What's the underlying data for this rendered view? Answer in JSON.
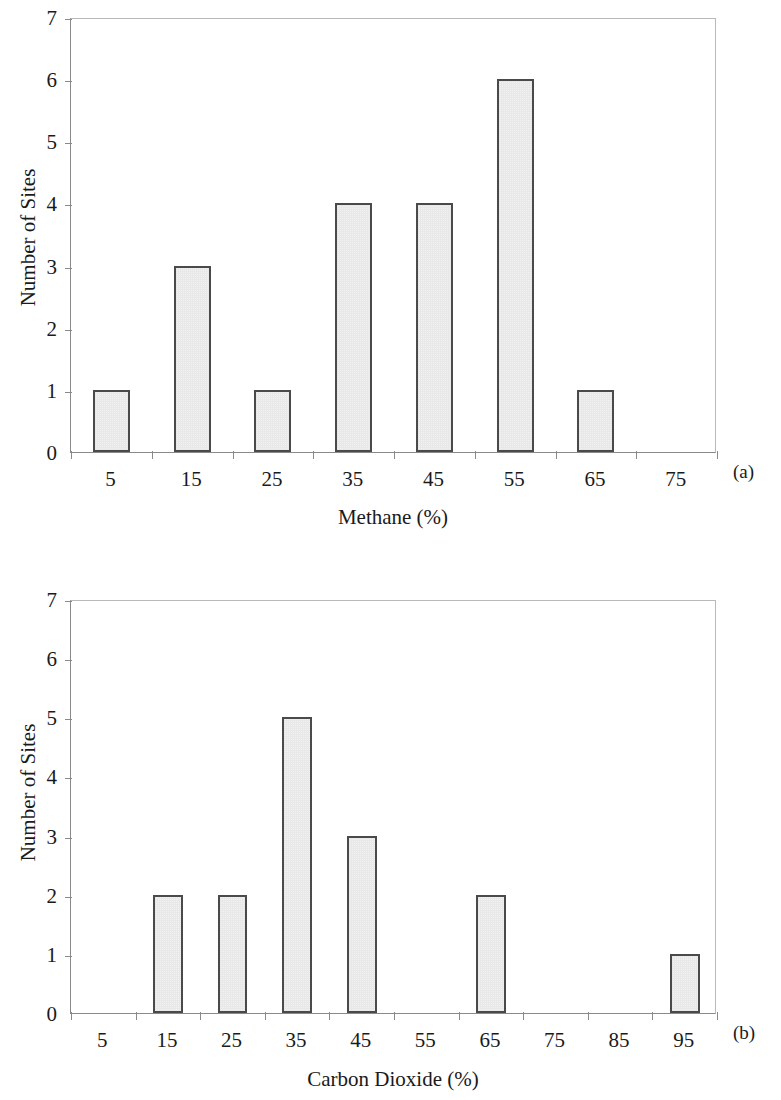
{
  "figure": {
    "panel_tags": [
      "(a)",
      "(b)"
    ]
  },
  "chart_data": [
    {
      "type": "bar",
      "title": "",
      "xlabel": "Methane (%)",
      "ylabel": "Number of Sites",
      "categories": [
        "5",
        "15",
        "25",
        "35",
        "45",
        "55",
        "65",
        "75"
      ],
      "values": [
        1,
        3,
        1,
        4,
        4,
        6,
        1,
        0
      ],
      "xtick_labels": [
        "5",
        "15",
        "25",
        "35",
        "45",
        "55",
        "65",
        "75"
      ],
      "ytick_labels": [
        "0",
        "1",
        "2",
        "3",
        "4",
        "5",
        "6",
        "7"
      ],
      "ylim": [
        0,
        7
      ],
      "grid": false,
      "legend": "none",
      "panel_tag": "(a)"
    },
    {
      "type": "bar",
      "title": "",
      "xlabel": "Carbon Dioxide (%)",
      "ylabel": "Number of Sites",
      "categories": [
        "5",
        "15",
        "25",
        "35",
        "45",
        "55",
        "65",
        "75",
        "85",
        "95"
      ],
      "values": [
        0,
        2,
        2,
        5,
        3,
        0,
        2,
        0,
        0,
        1
      ],
      "xtick_labels": [
        "5",
        "15",
        "25",
        "35",
        "45",
        "55",
        "65",
        "75",
        "85",
        "95"
      ],
      "ytick_labels": [
        "0",
        "1",
        "2",
        "3",
        "4",
        "5",
        "6",
        "7"
      ],
      "ylim": [
        0,
        7
      ],
      "grid": false,
      "legend": "none",
      "panel_tag": "(b)"
    }
  ]
}
